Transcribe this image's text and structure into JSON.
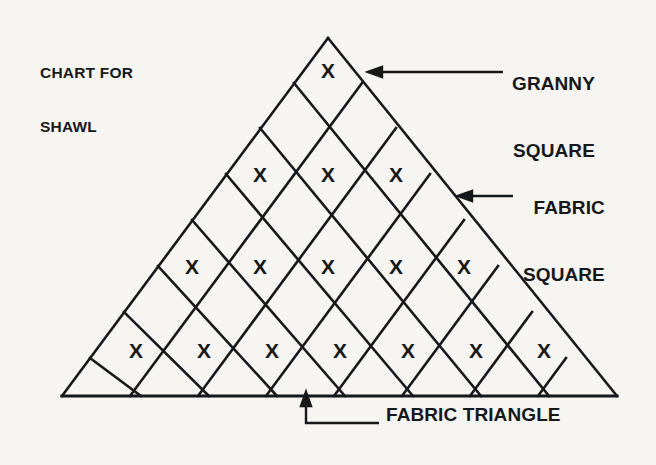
{
  "page": {
    "background_color": "#f6f5f2",
    "ink_color": "#16181a"
  },
  "title": {
    "line1": "CHART FOR",
    "line2": "SHAWL"
  },
  "annotations": {
    "granny_square": {
      "line1": "GRANNY",
      "line2": "SQUARE"
    },
    "fabric_square": {
      "line1": "FABRIC",
      "line2": "SQUARE"
    },
    "fabric_triangle": {
      "text": "FABRIC TRIANGLE"
    }
  },
  "chart_data": {
    "type": "diagram",
    "title": "CHART FOR SHAWL",
    "grid": {
      "apex": [
        328,
        38
      ],
      "left_corner": [
        62,
        396
      ],
      "right_corner": [
        617,
        396
      ],
      "cell_pitch": 68,
      "rows": 7
    },
    "legend": [
      {
        "key": "granny_square",
        "label": "GRANNY SQUARE",
        "marker": "X",
        "points_to": [
          372,
          72
        ]
      },
      {
        "key": "fabric_square",
        "label": "FABRIC SQUARE",
        "marker": "",
        "points_to": [
          461,
          196
        ]
      },
      {
        "key": "fabric_triangle",
        "label": "FABRIC TRIANGLE",
        "marker": "",
        "points_to": [
          306,
          396
        ]
      }
    ],
    "marked_rows": [
      {
        "row": 1,
        "marks": 1,
        "y": 72,
        "x": [
          328
        ]
      },
      {
        "row": 2,
        "marks": 3,
        "y": 176,
        "x": [
          260,
          328,
          396
        ]
      },
      {
        "row": 3,
        "marks": 5,
        "y": 268,
        "x": [
          192,
          260,
          328,
          396,
          464
        ]
      },
      {
        "row": 4,
        "marks": 7,
        "y": 352,
        "x": [
          136,
          204,
          272,
          340,
          408,
          476,
          544
        ]
      }
    ],
    "marks_per_row": [
      1,
      3,
      5,
      7
    ],
    "total_marks": 16,
    "mark_glyph": "X"
  }
}
